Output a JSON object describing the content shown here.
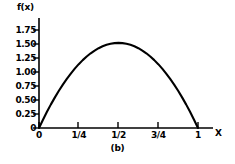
{
  "chart_data": {
    "type": "line",
    "title": "",
    "caption": "(b)",
    "xlabel": "X",
    "ylabel": "f(x)",
    "xlim": [
      0,
      1
    ],
    "ylim": [
      0,
      1.75
    ],
    "grid": false,
    "legend": null,
    "x_tick_labels": [
      "0",
      "1/4",
      "1/2",
      "3/4",
      "1"
    ],
    "x_tick_values": [
      0,
      0.25,
      0.5,
      0.75,
      1
    ],
    "y_tick_labels": [
      "0",
      "0.25",
      "0.50",
      "0.75",
      "1.00",
      "1.25",
      "1.50",
      "1.75"
    ],
    "y_tick_values": [
      0,
      0.25,
      0.5,
      0.75,
      1.0,
      1.25,
      1.5,
      1.75
    ],
    "series": [
      {
        "name": "f(x)",
        "color": "#000000",
        "x": [
          0,
          0.025,
          0.05,
          0.075,
          0.1,
          0.125,
          0.15,
          0.175,
          0.2,
          0.225,
          0.25,
          0.275,
          0.3,
          0.325,
          0.35,
          0.375,
          0.4,
          0.425,
          0.45,
          0.475,
          0.5,
          0.525,
          0.55,
          0.575,
          0.6,
          0.625,
          0.65,
          0.675,
          0.7,
          0.725,
          0.75,
          0.775,
          0.8,
          0.825,
          0.85,
          0.875,
          0.9,
          0.925,
          0.95,
          0.975,
          1
        ],
        "values": [
          0,
          0.148,
          0.289,
          0.422,
          0.547,
          0.665,
          0.775,
          0.877,
          0.972,
          1.06,
          1.14,
          1.212,
          1.277,
          1.334,
          1.383,
          1.425,
          1.459,
          1.485,
          1.504,
          1.516,
          1.52,
          1.516,
          1.504,
          1.485,
          1.459,
          1.425,
          1.383,
          1.334,
          1.277,
          1.212,
          1.14,
          1.06,
          0.972,
          0.877,
          0.775,
          0.665,
          0.547,
          0.422,
          0.289,
          0.148,
          0
        ]
      }
    ]
  },
  "geometry": {
    "origin_x": 39,
    "origin_y": 128,
    "x_at_one": 198,
    "axis_right_end": 212,
    "y_top": 22,
    "y_at_max_tick": 30
  }
}
